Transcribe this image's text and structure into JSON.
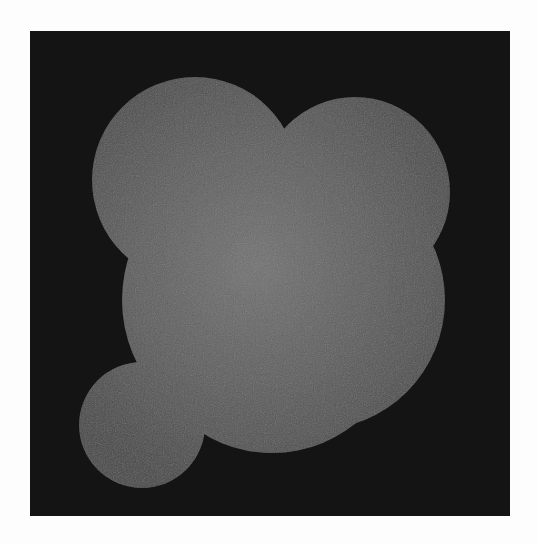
{
  "image": {
    "description": "Grayscale image of a soft gray cloud-like blob formed by overlapping circles on a dark square background, framed by white margins",
    "colors": {
      "page_background": "#fdfdfd",
      "square_background": "#141414",
      "blob_center": "#727272",
      "blob_mid": "#5c5c5c",
      "blob_edge": "#474747"
    },
    "square": {
      "x": 30,
      "y": 31,
      "width": 480,
      "height": 485
    },
    "blob": {
      "gradient_center": {
        "x": 255,
        "y": 265
      },
      "circles": [
        {
          "name": "top-left-lobe",
          "cx": 195,
          "cy": 180,
          "r": 103
        },
        {
          "name": "top-right-lobe",
          "cx": 355,
          "cy": 192,
          "r": 95
        },
        {
          "name": "central-lobe",
          "cx": 262,
          "cy": 300,
          "r": 140
        },
        {
          "name": "lower-right-lobe",
          "cx": 315,
          "cy": 300,
          "r": 130
        },
        {
          "name": "bottom-center-lobe",
          "cx": 272,
          "cy": 320,
          "r": 133
        },
        {
          "name": "bottom-left-lobe",
          "cx": 142,
          "cy": 425,
          "r": 63
        }
      ]
    }
  }
}
